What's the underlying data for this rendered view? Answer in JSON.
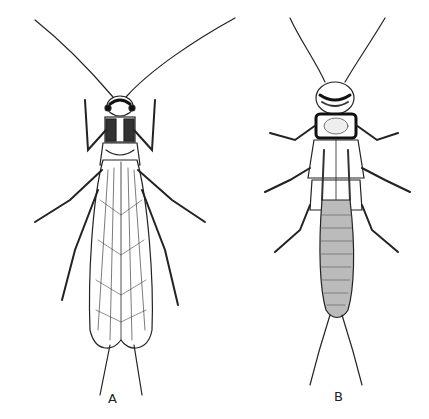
{
  "figure": {
    "panels": [
      {
        "label": "A",
        "subject": "adult-stonefly-dorsal"
      },
      {
        "label": "B",
        "subject": "stonefly-nymph-dorsal"
      }
    ]
  }
}
